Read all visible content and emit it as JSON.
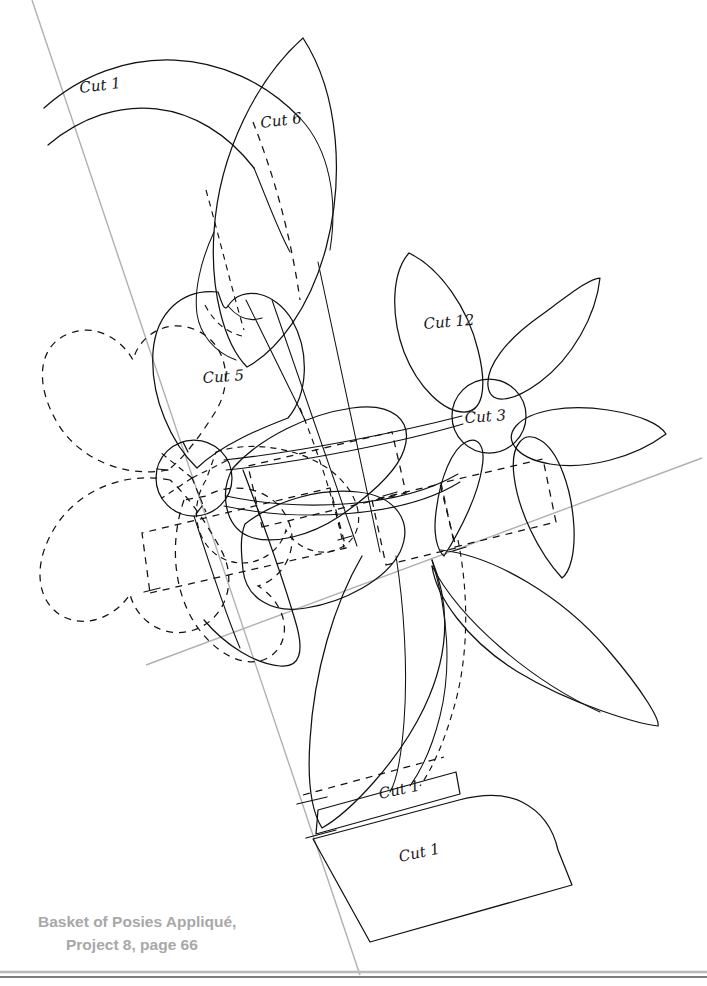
{
  "page": {
    "width": 707,
    "height": 986,
    "background": "#ffffff",
    "type": "applique-pattern-template-sheet"
  },
  "caption": {
    "line1": "Basket of Posies Appliqué,",
    "line2": "Project 8, page 66",
    "color": "#a8a8a8"
  },
  "labels": {
    "cut1_top": "Cut 1",
    "cut6": "Cut 6",
    "cut5": "Cut 5",
    "cut12": "Cut 12",
    "cut3": "Cut 3",
    "cut1_stem": "Cut 1",
    "cut1_basket": "Cut 1"
  },
  "colors": {
    "ink": "#111111",
    "guide_line": "#b0b0b0",
    "caption": "#a8a8a8",
    "page_edge": "#b9b9b9"
  },
  "line_styles": {
    "solid": "cut line",
    "dashed": "placement / underlay line",
    "gray": "registration guide line"
  },
  "pieces": [
    {
      "name": "arc-band-top-left",
      "label": "Cut 1",
      "style": "solid"
    },
    {
      "name": "leaf-upper-center",
      "label": "Cut 6",
      "style": "solid-with-dashed-vein"
    },
    {
      "name": "petal-heart-left",
      "label": "Cut 5",
      "style": "solid"
    },
    {
      "name": "flower-petal-upper",
      "label": "Cut 12",
      "style": "solid"
    },
    {
      "name": "flower-center-circle",
      "label": "Cut 3",
      "style": "solid"
    },
    {
      "name": "posy-dashed-left",
      "label": "",
      "style": "dashed"
    },
    {
      "name": "stem-band",
      "label": "Cut 1",
      "style": "solid"
    },
    {
      "name": "basket-body",
      "label": "Cut 1",
      "style": "solid"
    }
  ]
}
